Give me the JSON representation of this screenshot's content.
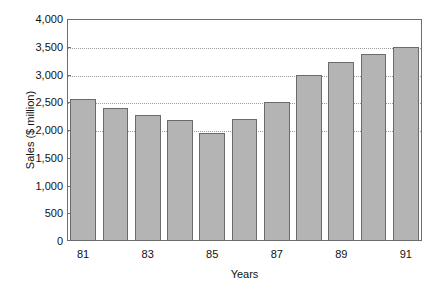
{
  "chart_data": {
    "type": "bar",
    "title": "",
    "xlabel": "Years",
    "ylabel": "Sales ($ million)",
    "categories": [
      "81",
      "82",
      "83",
      "84",
      "85",
      "86",
      "87",
      "88",
      "89",
      "90",
      "91"
    ],
    "values": [
      2550,
      2400,
      2270,
      2180,
      1950,
      2190,
      2510,
      3000,
      3230,
      3370,
      3500
    ],
    "ylim": [
      0,
      4000
    ],
    "y_ticks": [
      0,
      500,
      1000,
      1500,
      2000,
      2500,
      3000,
      3500,
      4000
    ],
    "y_tick_labels": [
      "0",
      "500",
      "1,000",
      "1,500",
      "2,000",
      "2,500",
      "3,000",
      "3,500",
      "4,000"
    ],
    "x_tick_labels": [
      "81",
      "83",
      "85",
      "87",
      "89",
      "91"
    ],
    "x_tick_categories": [
      "81",
      "83",
      "85",
      "87",
      "89",
      "91"
    ],
    "gridlines": [
      2000,
      2500,
      3000,
      3500
    ],
    "grid": true,
    "legend": null,
    "bar_color": "#b4b4b4",
    "bar_border_color": "#6b6b6b",
    "axis_color": "#6e6e6e",
    "grid_color": "#9a9a9a",
    "text_color": "#111111",
    "background": "#ffffff"
  }
}
